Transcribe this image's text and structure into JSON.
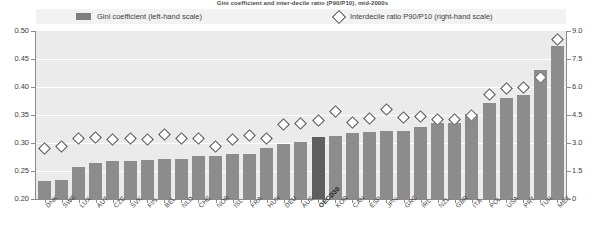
{
  "title": "Gini coefficient and inter-decile ratio (P90/P10), mid-2000s",
  "legend": {
    "gini": {
      "label": "Gini coefficient (left-hand scale)",
      "icon": "bar-swatch",
      "color": "#8c8c8c"
    },
    "ratio": {
      "label": "Interdecile ratio P90/P10 (right-hand scale)",
      "icon": "diamond-marker",
      "color": "#ffffff"
    }
  },
  "axes": {
    "left": {
      "ticks": [
        "0.50",
        "0.45",
        "0.40",
        "0.35",
        "0.30",
        "0.25",
        "0.20"
      ],
      "min": 0.2,
      "max": 0.5
    },
    "right": {
      "ticks": [
        "9.0",
        "7.5",
        "6.0",
        "4.5",
        "3.0",
        "1.5",
        "0"
      ],
      "min": 0.0,
      "max": 9.0
    }
  },
  "highlight": {
    "category": "OECD30",
    "color": "#5e5e5e"
  },
  "chart_data": {
    "type": "bar",
    "title": "Gini coefficient and inter-decile ratio (P90/P10), mid-2000s",
    "xlabel": "",
    "ylabel": "Gini coefficient",
    "ylim": [
      0.2,
      0.5
    ],
    "y2label": "Interdecile ratio P90/P10",
    "y2lim": [
      0.0,
      9.0
    ],
    "grid": true,
    "legend_position": "top",
    "categories": [
      "DNK",
      "SWE",
      "LUX",
      "AUT",
      "CZE",
      "SVK",
      "FIN",
      "BEL",
      "NLD",
      "CHE",
      "NOR",
      "ISL",
      "FRA",
      "HUN",
      "DEU",
      "AUS",
      "OECD30",
      "KOR",
      "CAN",
      "ESP",
      "JPN",
      "GRC",
      "IRL",
      "NZL",
      "GBR",
      "ITA",
      "POL",
      "USA",
      "PRT",
      "TUR",
      "MEX"
    ],
    "series": [
      {
        "name": "Gini coefficient (left-hand scale)",
        "axis": "left",
        "type": "bar",
        "values": [
          0.232,
          0.234,
          0.258,
          0.265,
          0.268,
          0.268,
          0.269,
          0.271,
          0.271,
          0.276,
          0.276,
          0.28,
          0.281,
          0.291,
          0.298,
          0.301,
          0.311,
          0.312,
          0.317,
          0.319,
          0.321,
          0.321,
          0.328,
          0.335,
          0.335,
          0.352,
          0.372,
          0.381,
          0.385,
          0.43,
          0.474
        ]
      },
      {
        "name": "Interdecile ratio P90/P10 (right-hand scale)",
        "axis": "right",
        "type": "scatter",
        "values": [
          2.72,
          2.79,
          3.24,
          3.27,
          3.2,
          3.26,
          3.21,
          3.43,
          3.23,
          3.26,
          2.83,
          3.19,
          3.39,
          3.25,
          3.98,
          4.05,
          4.18,
          4.71,
          4.12,
          4.33,
          4.77,
          4.39,
          4.42,
          4.27,
          4.27,
          4.45,
          5.61,
          5.91,
          5.98,
          6.5,
          8.53
        ]
      }
    ]
  }
}
